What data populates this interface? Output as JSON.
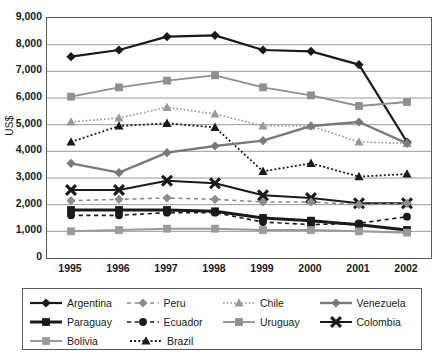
{
  "axes": {
    "ylabel": "US$",
    "yticks": [
      "9,000",
      "8,000",
      "7,000",
      "6,000",
      "5,000",
      "4,000",
      "3,000",
      "2,000",
      "1,000",
      "0"
    ],
    "xticks": [
      "1995",
      "1996",
      "1997",
      "1998",
      "1999",
      "2000",
      "2001",
      "2002"
    ]
  },
  "legend": {
    "rows": [
      [
        {
          "name": "Argentina",
          "color": "#1a1a1a",
          "marker": "diamond",
          "dash": "solid",
          "width": 2.2
        },
        {
          "name": "Peru",
          "color": "#8c8c8c",
          "marker": "diamond",
          "dash": "dashed",
          "width": 1.6
        },
        {
          "name": "Chile",
          "color": "#9a9a9a",
          "marker": "triangle",
          "dash": "dotted",
          "width": 1.6
        },
        {
          "name": "Venezuela",
          "color": "#7a7a7a",
          "marker": "diamond",
          "dash": "solid",
          "width": 2.4
        }
      ],
      [
        {
          "name": "Paraguay",
          "color": "#1a1a1a",
          "marker": "square",
          "dash": "solid",
          "width": 3.0
        },
        {
          "name": "Ecuador",
          "color": "#1a1a1a",
          "marker": "circle",
          "dash": "dashed",
          "width": 1.6
        },
        {
          "name": "Uruguay",
          "color": "#8f8f8f",
          "marker": "square",
          "dash": "solid",
          "width": 1.8
        },
        {
          "name": "Colombia",
          "color": "#1a1a1a",
          "marker": "cross",
          "dash": "solid",
          "width": 2.0
        }
      ],
      [
        {
          "name": "Bolivia",
          "color": "#9a9a9a",
          "marker": "square",
          "dash": "solid",
          "width": 2.0
        },
        {
          "name": "Brazil",
          "color": "#1a1a1a",
          "marker": "triangle",
          "dash": "dotted",
          "width": 1.8
        }
      ]
    ]
  },
  "chart_data": {
    "type": "line",
    "title": "",
    "xlabel": "",
    "ylabel": "US$",
    "categories": [
      "1995",
      "1996",
      "1997",
      "1998",
      "1999",
      "2000",
      "2001",
      "2002"
    ],
    "ylim": [
      0,
      9000
    ],
    "ytick_step": 1000,
    "grid": true,
    "legend_position": "bottom",
    "series": [
      {
        "name": "Argentina",
        "color": "#1a1a1a",
        "marker": "diamond",
        "dash": "solid",
        "width": 2.2,
        "values": [
          7550,
          7800,
          8300,
          8350,
          7800,
          7750,
          7250,
          4350
        ]
      },
      {
        "name": "Uruguay",
        "color": "#8f8f8f",
        "marker": "square",
        "dash": "solid",
        "width": 1.8,
        "values": [
          6050,
          6400,
          6650,
          6850,
          6400,
          6100,
          5700,
          5850
        ]
      },
      {
        "name": "Chile",
        "color": "#9a9a9a",
        "marker": "triangle",
        "dash": "dotted",
        "width": 1.6,
        "values": [
          5100,
          5250,
          5650,
          5400,
          4950,
          4950,
          4350,
          4300
        ]
      },
      {
        "name": "Brazil",
        "color": "#1a1a1a",
        "marker": "triangle",
        "dash": "dotted",
        "width": 1.8,
        "values": [
          4350,
          4950,
          5050,
          4900,
          3250,
          3550,
          3050,
          3150
        ]
      },
      {
        "name": "Venezuela",
        "color": "#7a7a7a",
        "marker": "diamond",
        "dash": "solid",
        "width": 2.4,
        "values": [
          3550,
          3200,
          3950,
          4200,
          4400,
          4950,
          5100,
          4300
        ]
      },
      {
        "name": "Colombia",
        "color": "#1a1a1a",
        "marker": "cross",
        "dash": "solid",
        "width": 2.0,
        "values": [
          2550,
          2550,
          2900,
          2800,
          2350,
          2250,
          2050,
          2050
        ]
      },
      {
        "name": "Peru",
        "color": "#8c8c8c",
        "marker": "diamond",
        "dash": "dashed",
        "width": 1.6,
        "values": [
          2150,
          2200,
          2250,
          2200,
          2100,
          2100,
          2000,
          2050
        ]
      },
      {
        "name": "Paraguay",
        "color": "#1a1a1a",
        "marker": "square",
        "dash": "solid",
        "width": 3.0,
        "values": [
          1800,
          1800,
          1800,
          1750,
          1500,
          1400,
          1250,
          1050
        ]
      },
      {
        "name": "Ecuador",
        "color": "#1a1a1a",
        "marker": "circle",
        "dash": "dashed",
        "width": 1.6,
        "values": [
          1600,
          1600,
          1700,
          1700,
          1350,
          1250,
          1300,
          1550
        ]
      },
      {
        "name": "Bolivia",
        "color": "#9a9a9a",
        "marker": "square",
        "dash": "solid",
        "width": 2.0,
        "values": [
          1000,
          1050,
          1100,
          1100,
          1050,
          1050,
          1000,
          950
        ]
      }
    ]
  }
}
